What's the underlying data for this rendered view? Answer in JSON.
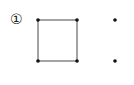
{
  "figure": {
    "label": "①",
    "stroke_color": "#555555",
    "dot_color": "#111111",
    "square": {
      "corners": [
        [
          38,
          20
        ],
        [
          77,
          20
        ],
        [
          77,
          61
        ],
        [
          38,
          61
        ]
      ]
    },
    "extra_points": [
      [
        115,
        20
      ],
      [
        115,
        61
      ]
    ]
  }
}
